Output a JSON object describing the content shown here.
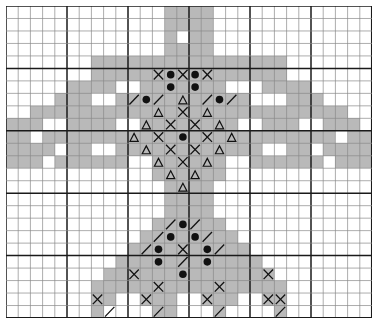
{
  "chart_data": {
    "type": "heatmap",
    "title": "",
    "subtitle": "",
    "xlabel": "",
    "ylabel": "",
    "legend": [],
    "grid": true,
    "cols": 30,
    "rows": 25,
    "cell_px": 12.2,
    "row_px": 12.48,
    "origin": {
      "x": 6,
      "y": 6
    },
    "heavy_every": 5,
    "colors": {
      "fill": "#b9b9b9",
      "blank": "#ffffff",
      "thin_line": "#8a8a8a",
      "heavy_line": "#1a1a1a",
      "symbol": "#111111",
      "background": "#ffffff"
    },
    "symbol_key": {
      "fill": "filled-gray-square",
      "cross": "x-cross-symbol",
      "dot": "filled-circle-symbol",
      "tri": "open-triangle-symbol",
      "slash": "diagonal-slash-symbol",
      "backslash": "diagonal-backslash-symbol"
    },
    "x": [
      1,
      2,
      3,
      4,
      5,
      6,
      7,
      8,
      9,
      10,
      11,
      12,
      13,
      14,
      15,
      16,
      17,
      18,
      19,
      20,
      21,
      22,
      23,
      24,
      25,
      26,
      27,
      28,
      29,
      30
    ],
    "y": [
      1,
      2,
      3,
      4,
      5,
      6,
      7,
      8,
      9,
      10,
      11,
      12,
      13,
      14,
      15,
      16,
      17,
      18,
      19,
      20,
      21,
      22,
      23,
      24,
      25
    ],
    "filled_cells": [
      [
        13,
        0
      ],
      [
        14,
        0
      ],
      [
        15,
        0
      ],
      [
        16,
        0
      ],
      [
        13,
        1
      ],
      [
        14,
        1
      ],
      [
        15,
        1
      ],
      [
        16,
        1
      ],
      [
        13,
        2
      ],
      [
        15,
        2
      ],
      [
        16,
        2
      ],
      [
        13,
        3
      ],
      [
        14,
        3
      ],
      [
        15,
        3
      ],
      [
        16,
        3
      ],
      [
        7,
        4
      ],
      [
        8,
        4
      ],
      [
        9,
        4
      ],
      [
        10,
        4
      ],
      [
        11,
        4
      ],
      [
        12,
        4
      ],
      [
        13,
        4
      ],
      [
        14,
        4
      ],
      [
        15,
        4
      ],
      [
        16,
        4
      ],
      [
        17,
        4
      ],
      [
        18,
        4
      ],
      [
        19,
        4
      ],
      [
        20,
        4
      ],
      [
        21,
        4
      ],
      [
        22,
        4
      ],
      [
        7,
        5
      ],
      [
        8,
        5
      ],
      [
        9,
        5
      ],
      [
        10,
        5
      ],
      [
        11,
        5
      ],
      [
        12,
        5
      ],
      [
        13,
        5
      ],
      [
        14,
        5
      ],
      [
        15,
        5
      ],
      [
        16,
        5
      ],
      [
        17,
        5
      ],
      [
        18,
        5
      ],
      [
        19,
        5
      ],
      [
        20,
        5
      ],
      [
        21,
        5
      ],
      [
        22,
        5
      ],
      [
        5,
        6
      ],
      [
        6,
        6
      ],
      [
        7,
        6
      ],
      [
        8,
        6
      ],
      [
        11,
        6
      ],
      [
        12,
        6
      ],
      [
        13,
        6
      ],
      [
        14,
        6
      ],
      [
        15,
        6
      ],
      [
        16,
        6
      ],
      [
        17,
        6
      ],
      [
        21,
        6
      ],
      [
        22,
        6
      ],
      [
        23,
        6
      ],
      [
        24,
        6
      ],
      [
        4,
        7
      ],
      [
        5,
        7
      ],
      [
        6,
        7
      ],
      [
        9,
        7
      ],
      [
        10,
        7
      ],
      [
        11,
        7
      ],
      [
        12,
        7
      ],
      [
        13,
        7
      ],
      [
        14,
        7
      ],
      [
        15,
        7
      ],
      [
        16,
        7
      ],
      [
        17,
        7
      ],
      [
        18,
        7
      ],
      [
        19,
        7
      ],
      [
        23,
        7
      ],
      [
        24,
        7
      ],
      [
        25,
        7
      ],
      [
        2,
        8
      ],
      [
        3,
        8
      ],
      [
        4,
        8
      ],
      [
        5,
        8
      ],
      [
        6,
        8
      ],
      [
        7,
        8
      ],
      [
        8,
        8
      ],
      [
        9,
        8
      ],
      [
        10,
        8
      ],
      [
        11,
        8
      ],
      [
        12,
        8
      ],
      [
        13,
        8
      ],
      [
        14,
        8
      ],
      [
        15,
        8
      ],
      [
        16,
        8
      ],
      [
        17,
        8
      ],
      [
        18,
        8
      ],
      [
        19,
        8
      ],
      [
        20,
        8
      ],
      [
        21,
        8
      ],
      [
        22,
        8
      ],
      [
        23,
        8
      ],
      [
        24,
        8
      ],
      [
        25,
        8
      ],
      [
        26,
        8
      ],
      [
        27,
        8
      ],
      [
        0,
        9
      ],
      [
        1,
        9
      ],
      [
        2,
        9
      ],
      [
        5,
        9
      ],
      [
        6,
        9
      ],
      [
        7,
        9
      ],
      [
        8,
        9
      ],
      [
        11,
        9
      ],
      [
        12,
        9
      ],
      [
        13,
        9
      ],
      [
        14,
        9
      ],
      [
        15,
        9
      ],
      [
        16,
        9
      ],
      [
        17,
        9
      ],
      [
        18,
        9
      ],
      [
        21,
        9
      ],
      [
        22,
        9
      ],
      [
        23,
        9
      ],
      [
        26,
        9
      ],
      [
        27,
        9
      ],
      [
        28,
        9
      ],
      [
        0,
        10
      ],
      [
        1,
        10
      ],
      [
        3,
        10
      ],
      [
        4,
        10
      ],
      [
        5,
        10
      ],
      [
        6,
        10
      ],
      [
        7,
        10
      ],
      [
        8,
        10
      ],
      [
        9,
        10
      ],
      [
        10,
        10
      ],
      [
        11,
        10
      ],
      [
        12,
        10
      ],
      [
        13,
        10
      ],
      [
        14,
        10
      ],
      [
        15,
        10
      ],
      [
        16,
        10
      ],
      [
        17,
        10
      ],
      [
        18,
        10
      ],
      [
        19,
        10
      ],
      [
        20,
        10
      ],
      [
        21,
        10
      ],
      [
        22,
        10
      ],
      [
        23,
        10
      ],
      [
        24,
        10
      ],
      [
        25,
        10
      ],
      [
        26,
        10
      ],
      [
        28,
        10
      ],
      [
        29,
        10
      ],
      [
        0,
        11
      ],
      [
        1,
        11
      ],
      [
        2,
        11
      ],
      [
        3,
        11
      ],
      [
        5,
        11
      ],
      [
        6,
        11
      ],
      [
        9,
        11
      ],
      [
        10,
        11
      ],
      [
        11,
        11
      ],
      [
        12,
        11
      ],
      [
        13,
        11
      ],
      [
        14,
        11
      ],
      [
        15,
        11
      ],
      [
        16,
        11
      ],
      [
        17,
        11
      ],
      [
        18,
        11
      ],
      [
        19,
        11
      ],
      [
        20,
        11
      ],
      [
        23,
        11
      ],
      [
        24,
        11
      ],
      [
        26,
        11
      ],
      [
        27,
        11
      ],
      [
        28,
        11
      ],
      [
        29,
        11
      ],
      [
        0,
        12
      ],
      [
        1,
        12
      ],
      [
        2,
        12
      ],
      [
        4,
        12
      ],
      [
        5,
        12
      ],
      [
        6,
        12
      ],
      [
        7,
        12
      ],
      [
        8,
        12
      ],
      [
        9,
        12
      ],
      [
        12,
        12
      ],
      [
        13,
        12
      ],
      [
        14,
        12
      ],
      [
        15,
        12
      ],
      [
        16,
        12
      ],
      [
        17,
        12
      ],
      [
        20,
        12
      ],
      [
        21,
        12
      ],
      [
        22,
        12
      ],
      [
        23,
        12
      ],
      [
        24,
        12
      ],
      [
        25,
        12
      ],
      [
        27,
        12
      ],
      [
        28,
        12
      ],
      [
        29,
        12
      ],
      [
        12,
        13
      ],
      [
        13,
        13
      ],
      [
        14,
        13
      ],
      [
        15,
        13
      ],
      [
        16,
        13
      ],
      [
        17,
        13
      ],
      [
        13,
        14
      ],
      [
        14,
        14
      ],
      [
        15,
        14
      ],
      [
        16,
        14
      ],
      [
        13,
        15
      ],
      [
        14,
        15
      ],
      [
        15,
        15
      ],
      [
        16,
        15
      ],
      [
        13,
        16
      ],
      [
        14,
        16
      ],
      [
        15,
        16
      ],
      [
        16,
        16
      ],
      [
        12,
        17
      ],
      [
        13,
        17
      ],
      [
        14,
        17
      ],
      [
        15,
        17
      ],
      [
        16,
        17
      ],
      [
        17,
        17
      ],
      [
        11,
        18
      ],
      [
        12,
        18
      ],
      [
        13,
        18
      ],
      [
        14,
        18
      ],
      [
        15,
        18
      ],
      [
        16,
        18
      ],
      [
        17,
        18
      ],
      [
        18,
        18
      ],
      [
        10,
        19
      ],
      [
        11,
        19
      ],
      [
        12,
        19
      ],
      [
        13,
        19
      ],
      [
        14,
        19
      ],
      [
        15,
        19
      ],
      [
        16,
        19
      ],
      [
        17,
        19
      ],
      [
        18,
        19
      ],
      [
        19,
        19
      ],
      [
        9,
        20
      ],
      [
        10,
        20
      ],
      [
        11,
        20
      ],
      [
        12,
        20
      ],
      [
        13,
        20
      ],
      [
        14,
        20
      ],
      [
        15,
        20
      ],
      [
        16,
        20
      ],
      [
        17,
        20
      ],
      [
        18,
        20
      ],
      [
        19,
        20
      ],
      [
        20,
        20
      ],
      [
        8,
        21
      ],
      [
        9,
        21
      ],
      [
        10,
        21
      ],
      [
        11,
        21
      ],
      [
        12,
        21
      ],
      [
        13,
        21
      ],
      [
        14,
        21
      ],
      [
        15,
        21
      ],
      [
        16,
        21
      ],
      [
        17,
        21
      ],
      [
        18,
        21
      ],
      [
        19,
        21
      ],
      [
        20,
        21
      ],
      [
        21,
        21
      ],
      [
        7,
        22
      ],
      [
        8,
        22
      ],
      [
        9,
        22
      ],
      [
        10,
        22
      ],
      [
        11,
        22
      ],
      [
        12,
        22
      ],
      [
        13,
        22
      ],
      [
        14,
        22
      ],
      [
        15,
        22
      ],
      [
        16,
        22
      ],
      [
        17,
        22
      ],
      [
        18,
        22
      ],
      [
        19,
        22
      ],
      [
        20,
        22
      ],
      [
        21,
        22
      ],
      [
        22,
        22
      ],
      [
        7,
        23
      ],
      [
        8,
        23
      ],
      [
        11,
        23
      ],
      [
        12,
        23
      ],
      [
        13,
        23
      ],
      [
        16,
        23
      ],
      [
        17,
        23
      ],
      [
        18,
        23
      ],
      [
        21,
        23
      ],
      [
        22,
        23
      ],
      [
        7,
        24
      ],
      [
        12,
        24
      ],
      [
        13,
        24
      ],
      [
        17,
        24
      ],
      [
        22,
        24
      ]
    ],
    "symbol_cells": [
      {
        "c": 12,
        "r": 5,
        "s": "cross"
      },
      {
        "c": 13,
        "r": 5,
        "s": "dot"
      },
      {
        "c": 14,
        "r": 5,
        "s": "cross"
      },
      {
        "c": 15,
        "r": 5,
        "s": "dot"
      },
      {
        "c": 16,
        "r": 5,
        "s": "cross"
      },
      {
        "c": 13,
        "r": 6,
        "s": "dot"
      },
      {
        "c": 15,
        "r": 6,
        "s": "dot"
      },
      {
        "c": 10,
        "r": 7,
        "s": "slash"
      },
      {
        "c": 11,
        "r": 7,
        "s": "dot"
      },
      {
        "c": 12,
        "r": 7,
        "s": "slash"
      },
      {
        "c": 14,
        "r": 7,
        "s": "tri"
      },
      {
        "c": 16,
        "r": 7,
        "s": "slash"
      },
      {
        "c": 17,
        "r": 7,
        "s": "dot"
      },
      {
        "c": 18,
        "r": 7,
        "s": "slash"
      },
      {
        "c": 12,
        "r": 8,
        "s": "tri"
      },
      {
        "c": 14,
        "r": 8,
        "s": "cross"
      },
      {
        "c": 16,
        "r": 8,
        "s": "tri"
      },
      {
        "c": 11,
        "r": 9,
        "s": "tri"
      },
      {
        "c": 13,
        "r": 9,
        "s": "cross"
      },
      {
        "c": 15,
        "r": 9,
        "s": "cross"
      },
      {
        "c": 17,
        "r": 9,
        "s": "tri"
      },
      {
        "c": 10,
        "r": 10,
        "s": "tri"
      },
      {
        "c": 12,
        "r": 10,
        "s": "cross"
      },
      {
        "c": 14,
        "r": 10,
        "s": "dot"
      },
      {
        "c": 16,
        "r": 10,
        "s": "cross"
      },
      {
        "c": 18,
        "r": 10,
        "s": "tri"
      },
      {
        "c": 11,
        "r": 11,
        "s": "tri"
      },
      {
        "c": 13,
        "r": 11,
        "s": "cross"
      },
      {
        "c": 15,
        "r": 11,
        "s": "cross"
      },
      {
        "c": 17,
        "r": 11,
        "s": "tri"
      },
      {
        "c": 12,
        "r": 12,
        "s": "tri"
      },
      {
        "c": 14,
        "r": 12,
        "s": "cross"
      },
      {
        "c": 16,
        "r": 12,
        "s": "tri"
      },
      {
        "c": 13,
        "r": 13,
        "s": "tri"
      },
      {
        "c": 15,
        "r": 13,
        "s": "tri"
      },
      {
        "c": 14,
        "r": 14,
        "s": "tri"
      },
      {
        "c": 13,
        "r": 17,
        "s": "slash"
      },
      {
        "c": 14,
        "r": 17,
        "s": "dot"
      },
      {
        "c": 15,
        "r": 17,
        "s": "slash"
      },
      {
        "c": 12,
        "r": 18,
        "s": "slash"
      },
      {
        "c": 13,
        "r": 18,
        "s": "dot"
      },
      {
        "c": 15,
        "r": 18,
        "s": "dot"
      },
      {
        "c": 16,
        "r": 18,
        "s": "slash"
      },
      {
        "c": 11,
        "r": 19,
        "s": "slash"
      },
      {
        "c": 12,
        "r": 19,
        "s": "dot"
      },
      {
        "c": 14,
        "r": 19,
        "s": "cross"
      },
      {
        "c": 16,
        "r": 19,
        "s": "dot"
      },
      {
        "c": 17,
        "r": 19,
        "s": "slash"
      },
      {
        "c": 12,
        "r": 20,
        "s": "dot"
      },
      {
        "c": 14,
        "r": 20,
        "s": "slash"
      },
      {
        "c": 16,
        "r": 20,
        "s": "dot"
      },
      {
        "c": 10,
        "r": 21,
        "s": "cross"
      },
      {
        "c": 14,
        "r": 21,
        "s": "dot"
      },
      {
        "c": 21,
        "r": 21,
        "s": "cross"
      },
      {
        "c": 12,
        "r": 22,
        "s": "cross"
      },
      {
        "c": 17,
        "r": 22,
        "s": "cross"
      },
      {
        "c": 7,
        "r": 23,
        "s": "cross"
      },
      {
        "c": 11,
        "r": 23,
        "s": "cross"
      },
      {
        "c": 16,
        "r": 23,
        "s": "cross"
      },
      {
        "c": 21,
        "r": 23,
        "s": "cross"
      },
      {
        "c": 22,
        "r": 23,
        "s": "cross"
      },
      {
        "c": 8,
        "r": 24,
        "s": "slash"
      },
      {
        "c": 12,
        "r": 24,
        "s": "slash"
      },
      {
        "c": 17,
        "r": 24,
        "s": "slash"
      },
      {
        "c": 22,
        "r": 24,
        "s": "slash"
      }
    ]
  }
}
